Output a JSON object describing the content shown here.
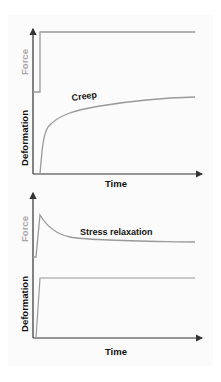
{
  "colors": {
    "axis": "#333333",
    "force": "#9a9a9a",
    "deformation": "#8a8a8a",
    "label_dark": "#111111",
    "label_light": "#a8a8a8",
    "panel": "#fbfbfb"
  },
  "top_chart": {
    "title": "Creep",
    "y_label_force": "Force",
    "y_label_deformation": "Deformation",
    "x_label": "Time",
    "force_description": "step up and held constant",
    "deformation_description": "rapid rise then gradual increase (creep)"
  },
  "bottom_chart": {
    "title": "Stress relaxation",
    "y_label_force": "Force",
    "y_label_deformation": "Deformation",
    "x_label": "Time",
    "force_description": "sharp peak then decays to plateau (stress relaxation)",
    "deformation_description": "step up and held constant"
  }
}
